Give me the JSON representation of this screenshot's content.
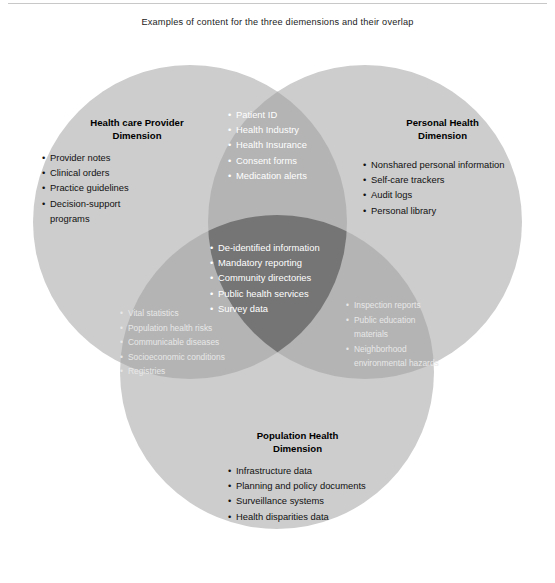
{
  "figure": {
    "title": "Examples of content for the three diemensions and their overlap"
  },
  "colors": {
    "background": "#ffffff",
    "circle_single": "#cdcdcd",
    "circle_double": "#b4b4b4",
    "circle_triple": "#757575",
    "text_dark": "#111111",
    "text_light": "#ffffff",
    "rule": "#c8c8c8"
  },
  "venn": {
    "circles": [
      {
        "id": "health-care-provider",
        "label": "Health care Provider Dimension",
        "cx": 190,
        "cy": 222,
        "r": 157
      },
      {
        "id": "personal-health",
        "label": "Personal Health Dimension",
        "cx": 365,
        "cy": 222,
        "r": 157
      },
      {
        "id": "population-health",
        "label": "Population Health Dimension",
        "cx": 277,
        "cy": 372,
        "r": 157
      }
    ]
  },
  "regions": {
    "health_care_provider": {
      "heading_line1": "Health care Provider",
      "heading_line2": "Dimension",
      "items": [
        "Provider notes",
        "Clinical orders",
        "Practice guidelines",
        "Decision-support"
      ],
      "continuation": "programs"
    },
    "personal_health": {
      "heading_line1": "Personal Health",
      "heading_line2": "Dimension",
      "items": [
        "Nonshared personal information",
        "Self-care trackers",
        "Audit logs",
        "Personal library"
      ]
    },
    "population_health": {
      "heading_line1": "Population Health",
      "heading_line2": "Dimension",
      "items": [
        "Infrastructure data",
        "Planning and policy documents",
        "Surveillance systems",
        "Health disparities data"
      ]
    },
    "overlap_provider_personal": {
      "items": [
        "Patient ID",
        "Health Industry",
        "Health Insurance",
        "Consent forms",
        "Medication alerts"
      ]
    },
    "overlap_all_three": {
      "items": [
        "De-identified information",
        "Mandatory reporting",
        "Community directories",
        "Public health services",
        "Survey data"
      ]
    },
    "overlap_provider_population": {
      "items": [
        "Vital statistics",
        "Population health risks",
        "Communicable diseases",
        "Socioeconomic conditions",
        "Registries"
      ]
    },
    "overlap_personal_population": {
      "items": [
        "Inspection reports",
        "Public education",
        "materials",
        "Neighborhood",
        "environmental hazards"
      ]
    }
  }
}
